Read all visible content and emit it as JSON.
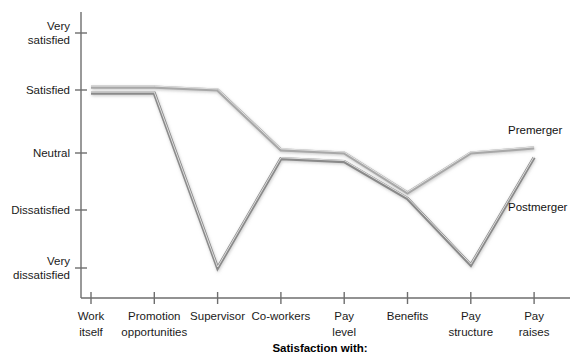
{
  "chart_data": {
    "type": "line",
    "title": "",
    "xlabel": "Satisfaction with:",
    "ylabel": "",
    "grid": false,
    "legend_position": "inline-right",
    "categories": [
      "Work itself",
      "Promotion opportunities",
      "Supervisor",
      "Co-workers",
      "Pay level",
      "Benefits",
      "Pay structure",
      "Pay raises"
    ],
    "category_lines": [
      [
        "Work",
        "itself"
      ],
      [
        "Promotion",
        "opportunities"
      ],
      [
        "Supervisor"
      ],
      [
        "Co-workers"
      ],
      [
        "Pay",
        "level"
      ],
      [
        "Benefits"
      ],
      [
        "Pay",
        "structure"
      ],
      [
        "Pay",
        "raises"
      ]
    ],
    "y_tick_labels": [
      [
        "Very",
        "satisfied"
      ],
      [
        "Satisfied"
      ],
      [
        "Neutral"
      ],
      [
        "Dissatisfied"
      ],
      [
        "Very",
        "dissatisfied"
      ]
    ],
    "y_scale_values": [
      5,
      4,
      3,
      2,
      1
    ],
    "ylim": [
      1,
      5
    ],
    "series": [
      {
        "name": "Premerger",
        "color": "#a8a8a8",
        "values": [
          4.05,
          4.05,
          4.0,
          3.05,
          3.0,
          2.3,
          3.0,
          3.08
        ]
      },
      {
        "name": "Postmerger",
        "color": "#8a8a8a",
        "values": [
          3.95,
          3.95,
          1.0,
          2.9,
          2.85,
          2.2,
          1.05,
          2.92
        ]
      }
    ],
    "annotations": [
      {
        "text": "Premerger",
        "series": "Premerger"
      },
      {
        "text": "Postmerger",
        "series": "Postmerger"
      }
    ]
  },
  "colors": {
    "axis": "#6e6e6e",
    "text": "#1a1a1a",
    "premerger": "#a8a8a8",
    "postmerger": "#8a8a8a",
    "background": "#ffffff"
  }
}
